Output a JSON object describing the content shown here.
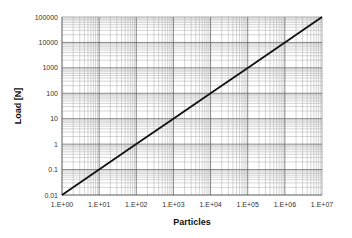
{
  "chart_data": {
    "type": "line",
    "title": "",
    "xlabel": "Particles",
    "ylabel": "Load [N]",
    "xscale": "log",
    "yscale": "log",
    "xlim": [
      1,
      10000000
    ],
    "ylim": [
      0.01,
      100000
    ],
    "grid": true,
    "legend": null,
    "x_tick_labels": [
      "1.E+00",
      "1.E+01",
      "1.E+02",
      "1.E+03",
      "1.E+04",
      "1.E+05",
      "1.E+06",
      "1.E+07"
    ],
    "y_tick_labels": [
      "0.01",
      "0.1",
      "1",
      "10",
      "100",
      "1000",
      "10000",
      "100000"
    ],
    "series": [
      {
        "name": "Load",
        "x": [
          1,
          10,
          100,
          1000,
          10000,
          100000,
          1000000,
          10000000
        ],
        "values": [
          0.01,
          0.1,
          1,
          10,
          100,
          1000,
          10000,
          100000
        ],
        "color": "#111111"
      }
    ]
  },
  "colors": {
    "line": "#111111",
    "major_grid": "#555555",
    "minor_grid": "#aaaaaa",
    "background": "#ffffff"
  }
}
